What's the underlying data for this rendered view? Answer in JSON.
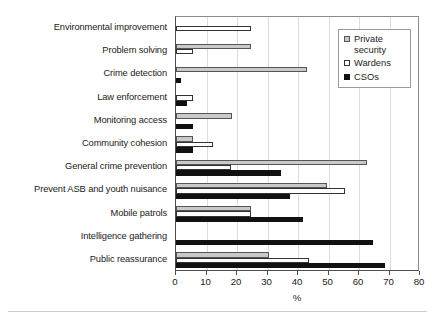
{
  "chart_data": {
    "type": "bar",
    "orientation": "horizontal",
    "title": "",
    "xlabel": "%",
    "ylabel": "",
    "xlim": [
      0,
      80
    ],
    "xticks": [
      0,
      10,
      20,
      30,
      40,
      50,
      60,
      70,
      80
    ],
    "grid": "vertical",
    "legend_position": "top-right",
    "categories": [
      "Environmental improvement",
      "Problem solving",
      "Crime detection",
      "Law enforcement",
      "Monitoring access",
      "Community cohesion",
      "General crime prevention",
      "Prevent ASB and youth nuisance",
      "Mobile patrols",
      "Intelligence gathering",
      "Public reassurance"
    ],
    "series": [
      {
        "name": "Private security",
        "legend_label": "Private\nsecurity",
        "color": "#c9c9c9",
        "edge_color": "#555555",
        "values": [
          0,
          24.5,
          43,
          0,
          18.5,
          5.5,
          62.5,
          49.5,
          24.5,
          0,
          30.5
        ]
      },
      {
        "name": "Wardens",
        "legend_label": "Wardens",
        "color": "#ffffff",
        "edge_color": "#333333",
        "values": [
          24.5,
          5.5,
          0,
          5.5,
          0,
          12,
          18,
          55.5,
          24.5,
          0,
          43.5
        ]
      },
      {
        "name": "CSOs",
        "legend_label": "CSOs",
        "color": "#111111",
        "edge_color": "#111111",
        "values": [
          0,
          0,
          1.5,
          3.5,
          5.5,
          5.5,
          34.5,
          37.5,
          41.5,
          64.5,
          68.5
        ]
      }
    ]
  }
}
